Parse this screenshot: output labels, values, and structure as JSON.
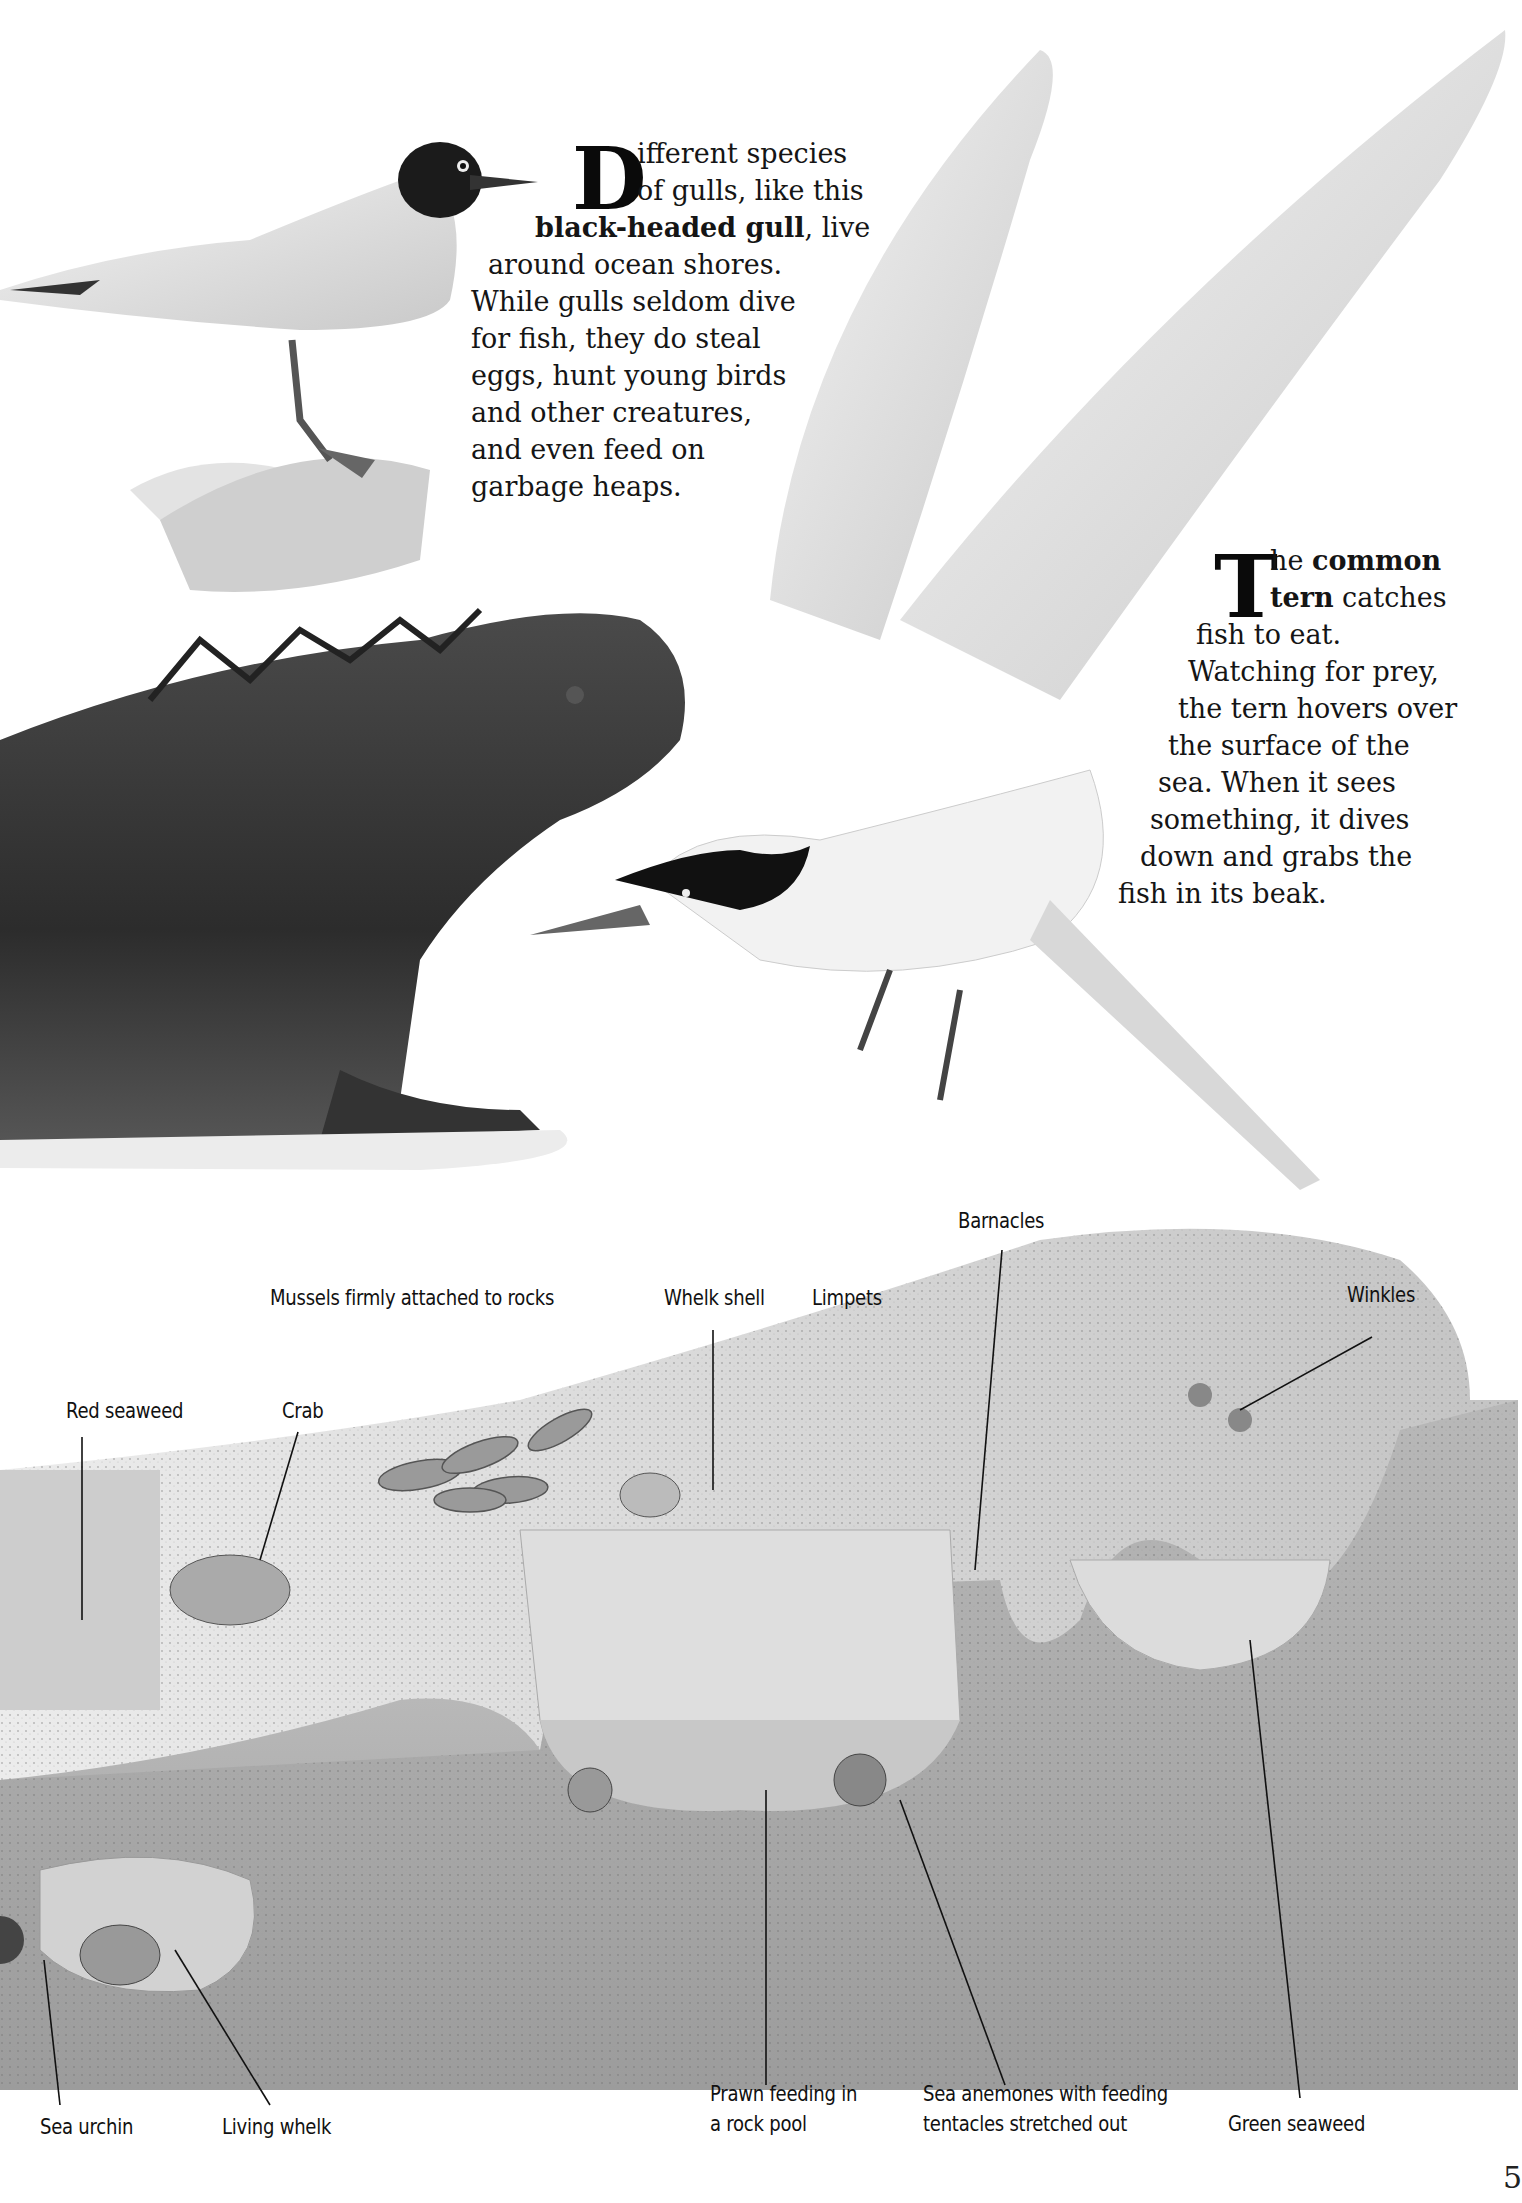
{
  "gull_paragraph": {
    "dropcap": "D",
    "lines": [
      {
        "text": "ifferent species"
      },
      {
        "text": "of gulls, like this"
      },
      {
        "bold": "black-headed gull",
        "text": ", live"
      },
      {
        "text": "around ocean shores."
      },
      {
        "text": "While gulls seldom dive"
      },
      {
        "text": "for fish, they do steal"
      },
      {
        "text": "eggs, hunt young birds"
      },
      {
        "text": "and other creatures,"
      },
      {
        "text": "and even feed on"
      },
      {
        "text": "garbage heaps."
      }
    ]
  },
  "tern_paragraph": {
    "dropcap": "T",
    "lines": [
      {
        "pre": "he ",
        "bold": "common"
      },
      {
        "bold": "tern",
        "text": " catches"
      },
      {
        "text": "fish to eat."
      },
      {
        "text": "Watching for prey,"
      },
      {
        "text": "the tern hovers over"
      },
      {
        "text": "the surface of the"
      },
      {
        "text": "sea. When it sees"
      },
      {
        "text": "something, it dives"
      },
      {
        "text": "down and grabs the"
      },
      {
        "text": "fish in its beak."
      }
    ]
  },
  "diagram_labels": {
    "barnacles": "Barnacles",
    "mussels": "Mussels firmly attached to rocks",
    "whelk_shell": "Whelk shell",
    "limpets": "Limpets",
    "winkles": "Winkles",
    "red_seaweed": "Red seaweed",
    "crab": "Crab",
    "sea_urchin": "Sea urchin",
    "living_whelk": "Living whelk",
    "prawn_line1": "Prawn feeding in",
    "prawn_line2": "a rock pool",
    "anemones_line1": "Sea anemones with feeding",
    "anemones_line2": "tentacles stretched out",
    "green_seaweed": "Green seaweed"
  },
  "page_number": "5",
  "colors": {
    "ink": "#111111",
    "rock_light": "#e6e6e6",
    "rock_mid": "#bdbdbd",
    "sand": "#a9a9a9",
    "water": "#dcdcdc",
    "iguana": "#3a3a3a"
  }
}
